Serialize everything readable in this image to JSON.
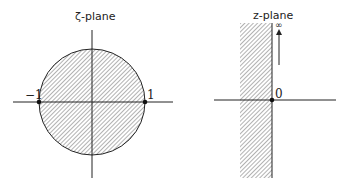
{
  "left_panel": {
    "title": "ζ-plane",
    "label_neg_one": "−1",
    "label_one": "1",
    "region": "unit disk (shaded)"
  },
  "right_panel": {
    "title": "z-plane",
    "label_origin": "0",
    "label_infinity": "∞",
    "region": "vertical strip left of imaginary axis (shaded)"
  },
  "colors": {
    "ink": "#222222",
    "hatch": "#555555",
    "background": "#ffffff"
  }
}
